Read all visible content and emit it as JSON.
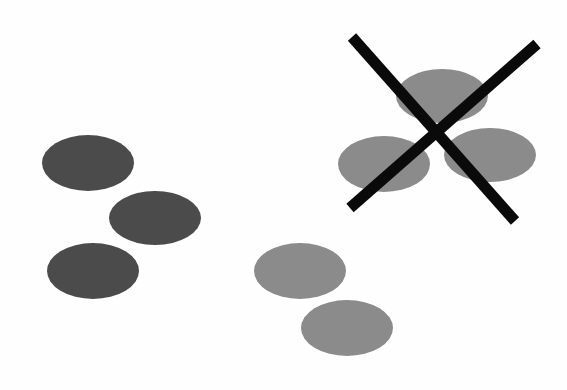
{
  "canvas": {
    "width": 567,
    "height": 390,
    "background": "#fefefe"
  },
  "colors": {
    "dark_ellipse": "#4b4b4b",
    "medium_ellipse": "#8b8b8b",
    "x_stroke": "#0a0a0a"
  },
  "groups": [
    {
      "name": "dark-ellipse-group",
      "ellipses": [
        {
          "cx": 88,
          "cy": 163,
          "rx": 46,
          "ry": 28
        },
        {
          "cx": 155,
          "cy": 218,
          "rx": 46,
          "ry": 27
        },
        {
          "cx": 93,
          "cy": 271,
          "rx": 46,
          "ry": 28
        }
      ]
    },
    {
      "name": "medium-ellipse-pair",
      "ellipses": [
        {
          "cx": 300,
          "cy": 271,
          "rx": 46,
          "ry": 28
        },
        {
          "cx": 347,
          "cy": 328,
          "rx": 46,
          "ry": 28
        }
      ]
    },
    {
      "name": "crossed-out-ellipse-group",
      "ellipses": [
        {
          "cx": 442,
          "cy": 96,
          "rx": 46,
          "ry": 27
        },
        {
          "cx": 384,
          "cy": 164,
          "rx": 46,
          "ry": 28
        },
        {
          "cx": 490,
          "cy": 155,
          "rx": 46,
          "ry": 27
        }
      ],
      "x_mark": {
        "stroke_width": 11,
        "lines": [
          {
            "x1": 352,
            "y1": 37,
            "x2": 515,
            "y2": 221
          },
          {
            "x1": 537,
            "y1": 44,
            "x2": 350,
            "y2": 208
          }
        ]
      }
    }
  ]
}
